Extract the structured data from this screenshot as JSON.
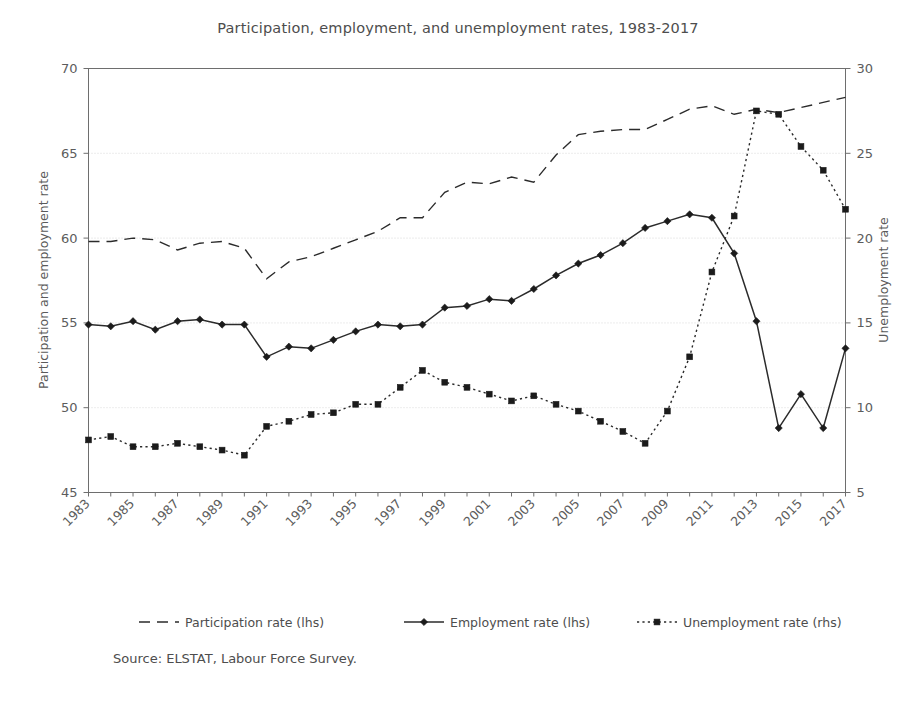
{
  "chart_data": {
    "type": "line",
    "title": "Participation, employment, and unemployment rates, 1983-2017",
    "xlabel": "",
    "ylabel": "Participation and employment rate",
    "y2label": "Unemployment rate",
    "ylim": [
      45,
      70
    ],
    "y2lim": [
      5,
      30
    ],
    "yticks": [
      45,
      50,
      55,
      60,
      65,
      70
    ],
    "y2ticks": [
      5,
      10,
      15,
      20,
      25,
      30
    ],
    "grid": true,
    "legend_position": "bottom",
    "source": "Source: ELSTAT, Labour Force Survey.",
    "x": [
      1983,
      1984,
      1985,
      1986,
      1987,
      1988,
      1989,
      1990,
      1991,
      1992,
      1993,
      1994,
      1995,
      1996,
      1997,
      1998,
      1999,
      2000,
      2001,
      2002,
      2003,
      2004,
      2005,
      2006,
      2007,
      2008,
      2009,
      2010,
      2011,
      2012,
      2013,
      2014,
      2015,
      2016,
      2017
    ],
    "xtick_labels": [
      "1983",
      "1985",
      "1987",
      "1989",
      "1991",
      "1993",
      "1995",
      "1997",
      "1999",
      "2001",
      "2003",
      "2005",
      "2007",
      "2009",
      "2011",
      "2013",
      "2015",
      "2017"
    ],
    "series": [
      {
        "name": "Participation rate (lhs)",
        "axis": "left",
        "style": "dashed",
        "marker": "none",
        "values": [
          59.8,
          59.8,
          60.0,
          59.9,
          59.3,
          59.7,
          59.8,
          59.4,
          57.6,
          58.6,
          58.9,
          59.4,
          59.9,
          60.4,
          61.2,
          61.2,
          62.7,
          63.3,
          63.2,
          63.6,
          63.3,
          64.9,
          66.1,
          66.3,
          66.4,
          66.4,
          67.0,
          67.6,
          67.8,
          67.3,
          67.6,
          67.4,
          67.7,
          68.0,
          68.3
        ]
      },
      {
        "name": "Employment rate (lhs)",
        "axis": "left",
        "style": "solid",
        "marker": "diamond",
        "values": [
          54.9,
          54.8,
          55.1,
          54.6,
          55.1,
          55.2,
          54.9,
          54.9,
          53.0,
          53.6,
          53.5,
          54.0,
          54.5,
          54.9,
          54.8,
          54.9,
          55.9,
          56.0,
          56.4,
          56.3,
          57.0,
          57.8,
          58.5,
          59.0,
          59.7,
          60.6,
          61.0,
          61.4,
          61.2,
          59.1,
          55.1,
          48.8,
          50.8,
          48.8,
          53.5
        ]
      },
      {
        "name": "Unemployment rate (rhs)",
        "axis": "right",
        "style": "dotted",
        "marker": "square",
        "values": [
          8.1,
          8.3,
          7.7,
          7.7,
          7.9,
          7.7,
          7.5,
          7.2,
          8.9,
          9.2,
          9.6,
          9.7,
          10.2,
          10.2,
          11.2,
          12.2,
          11.5,
          11.2,
          10.8,
          10.4,
          10.7,
          10.2,
          9.8,
          9.2,
          8.6,
          7.9,
          9.8,
          13.0,
          18.0,
          21.3,
          27.5,
          27.3,
          25.4,
          24.0,
          21.7
        ]
      }
    ]
  },
  "legend": {
    "items": [
      {
        "label": "Participation rate (lhs)",
        "style": "dashed",
        "marker": "none"
      },
      {
        "label": "Employment rate (lhs)",
        "style": "solid",
        "marker": "diamond"
      },
      {
        "label": "Unemployment rate (rhs)",
        "style": "dotted",
        "marker": "square"
      }
    ]
  },
  "colors": {
    "line": "#2b2b2b",
    "grid": "#cfcfcf",
    "frame": "#6e6e6e",
    "text": "#4d4d4d",
    "background": "#ffffff"
  }
}
